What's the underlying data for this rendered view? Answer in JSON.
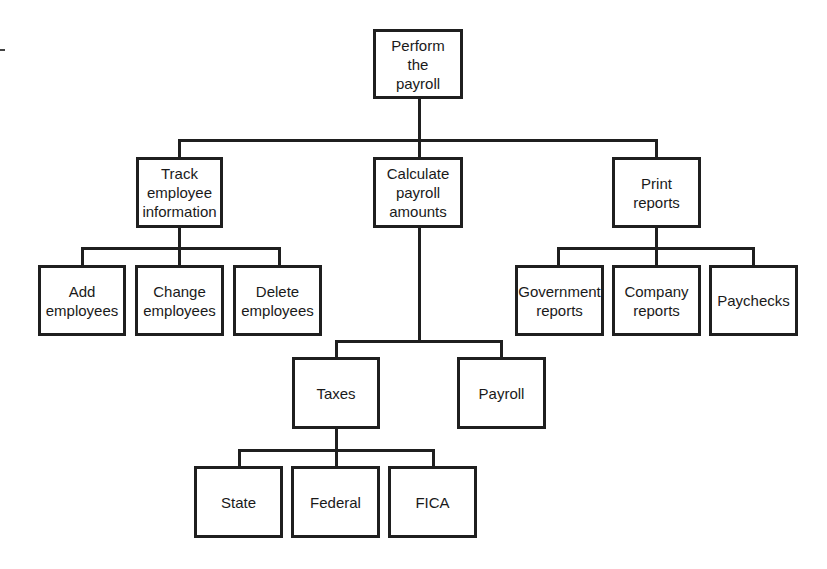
{
  "diagram": {
    "type": "hierarchy-chart",
    "root": {
      "label": "Perform\nthe\npayroll"
    },
    "level1": [
      {
        "label": "Track\nemployee\ninformation"
      },
      {
        "label": "Calculate\npayroll\namounts"
      },
      {
        "label": "Print\nreports"
      }
    ],
    "track_children": [
      {
        "label": "Add\nemployees"
      },
      {
        "label": "Change\nemployees"
      },
      {
        "label": "Delete\nemployees"
      }
    ],
    "print_children": [
      {
        "label": "Government\nreports"
      },
      {
        "label": "Company\nreports"
      },
      {
        "label": "Paychecks"
      }
    ],
    "calculate_children": [
      {
        "label": "Taxes"
      },
      {
        "label": "Payroll"
      }
    ],
    "taxes_children": [
      {
        "label": "State"
      },
      {
        "label": "Federal"
      },
      {
        "label": "FICA"
      }
    ],
    "colors": {
      "line": "#1f1f1f",
      "box_fill": "#ffffff",
      "background": "#ffffff"
    }
  }
}
